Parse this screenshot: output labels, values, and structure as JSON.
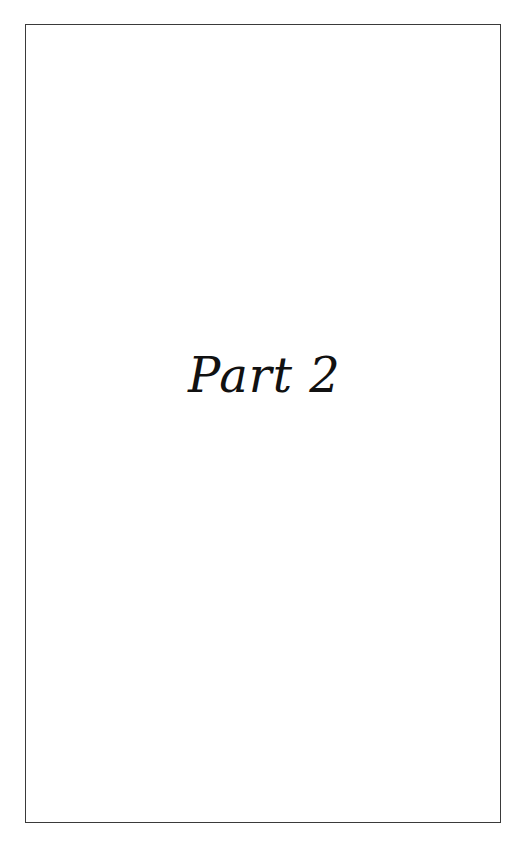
{
  "page": {
    "title": "Part 2",
    "background": "#ffffff",
    "border_color": "#3a3a3a",
    "text_color": "#111111"
  }
}
